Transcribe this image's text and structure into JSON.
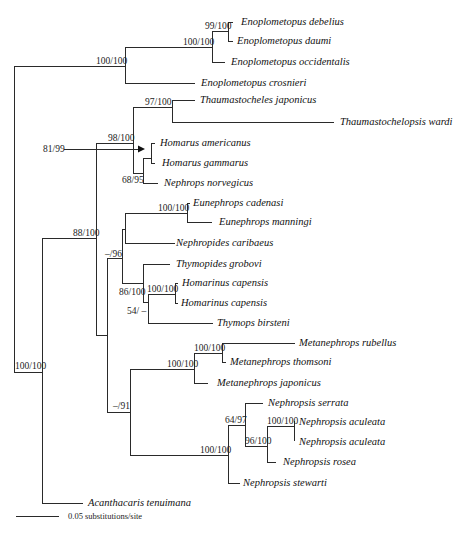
{
  "figure": {
    "type": "phylogenetic-tree",
    "scale_bar": {
      "label": "0.05 substitutions/site"
    },
    "arrow_annotation": {
      "label": "81/99"
    }
  },
  "taxa": [
    "Enoplometopus debelius",
    "Enoplometopus daumi",
    "Enoplometopus occidentalis",
    "Enoplometopus crosnieri",
    "Thaumastocheles japonicus",
    "Thaumastochelopsis wardi",
    "Homarus americanus",
    "Homarus gammarus",
    "Nephrops norvegicus",
    "Eunephrops cadenasi",
    "Eunephrops manningi",
    "Nephropides caribaeus",
    "Thymopides grobovi",
    "Homarinus capensis",
    "Homarinus capensis",
    "Thymops birsteni",
    "Metanephrops rubellus",
    "Metanephrops thomsoni",
    "Metanephrops japonicus",
    "Nephropsis serrata",
    "Nephropsis aculeata",
    "Nephropsis aculeata",
    "Nephropsis rosea",
    "Nephropsis stewarti",
    "Acanthacaris tenuimana"
  ],
  "support": {
    "enoplo_debelius_daumi": "99/100",
    "enoplo_inner": "100/100",
    "enoplo_clade": "100/100",
    "thaumastocheles": "97/100",
    "thaum_homarus": "98/100",
    "homarus_nephrops": "68/95",
    "eunephrops": "100/100",
    "main_clade": "88/100",
    "eunephrops_thymopides": "–/96",
    "homarinus": "100/100",
    "thymopides_clade": "86/100",
    "homarinus_thymops": "54/ –",
    "metanephrops_inner": "100/100",
    "metanephrops": "100/100",
    "root_ingroup": "100/100",
    "meta_nephropsis": "–/91",
    "nephropsis_serrata": "64/97",
    "nephropsis_aculeata": "100/100",
    "nephropsis_aculeata_rosea": "96/100",
    "nephropsis": "100/100"
  }
}
